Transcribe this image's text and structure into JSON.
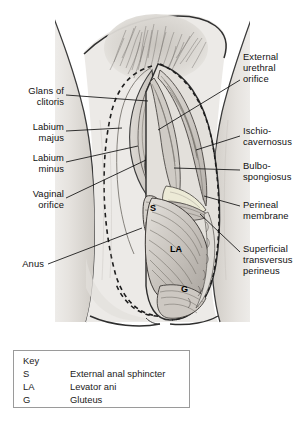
{
  "figure": {
    "style": "grayscale pencil medical illustration",
    "colors": {
      "skin_light": "#ebe9e6",
      "skin_mid": "#d6d3ce",
      "shadow": "#b3afaa",
      "deep_shadow": "#8d8984",
      "outline": "#2b2b2b",
      "muscle_light": "#e0ddd8",
      "muscle_mid": "#bdb8b2",
      "label_text": "#111111",
      "key_border": "#9a9a9a",
      "background": "#ffffff"
    }
  },
  "labels_left": [
    {
      "id": "glans-of-clitoris",
      "text": "Glans of\nclitoris",
      "x": 2,
      "y": 85,
      "width": 62
    },
    {
      "id": "labium-majus",
      "text": "Labium\nmajus",
      "x": 2,
      "y": 121,
      "width": 62
    },
    {
      "id": "labium-minus",
      "text": "Labium\nminus",
      "x": 2,
      "y": 152,
      "width": 62
    },
    {
      "id": "vaginal-orifice",
      "text": "Vaginal\norifice",
      "x": 2,
      "y": 188,
      "width": 62
    },
    {
      "id": "anus",
      "text": "Anus",
      "x": 2,
      "y": 258,
      "width": 62
    }
  ],
  "labels_right": [
    {
      "id": "external-urethral-orifice",
      "text": "External\nurethral\norifice",
      "x": 243,
      "y": 51,
      "width": 64
    },
    {
      "id": "ischio-cavernosus",
      "text": "Ischio-\ncavernosus",
      "x": 243,
      "y": 125,
      "width": 64
    },
    {
      "id": "bulbo-spongiosus",
      "text": "Bulbo-\nspongiosus",
      "x": 243,
      "y": 160,
      "width": 64
    },
    {
      "id": "perineal-membrane",
      "text": "Perineal\nmembrane",
      "x": 243,
      "y": 199,
      "width": 64
    },
    {
      "id": "superficial-transversus-perineus",
      "text": "Superficial\ntransversus\nperineus",
      "x": 243,
      "y": 243,
      "width": 64
    }
  ],
  "in_figure_labels": [
    {
      "id": "s",
      "text": "S",
      "x": 150,
      "y": 209
    },
    {
      "id": "la",
      "text": "LA",
      "x": 172,
      "y": 250
    },
    {
      "id": "g",
      "text": "G",
      "x": 182,
      "y": 288
    }
  ],
  "key": {
    "title": "Key",
    "rows": [
      {
        "abbr": "S",
        "definition": "External anal sphincter"
      },
      {
        "abbr": "LA",
        "definition": "Levator ani"
      },
      {
        "abbr": "G",
        "definition": "Gluteus"
      }
    ]
  }
}
